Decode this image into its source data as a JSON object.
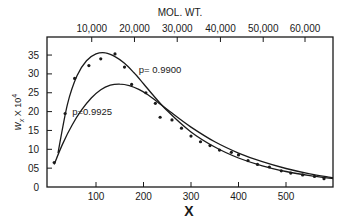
{
  "chart_data": {
    "type": "line",
    "title": "",
    "xlabel": "X",
    "ylabel": "w_x × 10^4",
    "top_xlabel": "MOL. WT.",
    "xlim": [
      0,
      600
    ],
    "ylim": [
      0,
      38
    ],
    "grid": false,
    "x_ticks": [
      100,
      200,
      300,
      400,
      500
    ],
    "x_tick_labels": [
      "100",
      "200",
      "300",
      "400",
      "500"
    ],
    "y_ticks": [
      0,
      5,
      10,
      15,
      20,
      25,
      30,
      35
    ],
    "y_tick_labels": [
      "0",
      "05",
      "10",
      "15",
      "20",
      "25",
      "30",
      "35"
    ],
    "top_x_ticks": [
      10000,
      20000,
      30000,
      40000,
      50000,
      60000
    ],
    "top_x_tick_labels": [
      "10,000",
      "20,000",
      "30,000",
      "40,000",
      "50,000",
      "60,000"
    ],
    "top_x_tick_positions_X": [
      91,
      181,
      271,
      362,
      452,
      540
    ],
    "series": [
      {
        "name": "p=0.9900",
        "kind": "curve",
        "label": "p= 0.9900",
        "x": [
          20,
          40,
          60,
          80,
          100,
          120,
          140,
          160,
          180,
          200,
          220,
          250,
          300,
          350,
          400,
          450,
          500,
          550,
          600
        ],
        "y": [
          9.0,
          22.0,
          29.5,
          33.5,
          35.3,
          35.6,
          34.6,
          32.8,
          30.3,
          27.4,
          24.4,
          20.2,
          14.6,
          10.6,
          7.7,
          5.6,
          4.1,
          3.0,
          2.2
        ]
      },
      {
        "name": "p=0.9925",
        "kind": "curve",
        "label": "p=0.9925",
        "x": [
          12,
          30,
          50,
          70,
          90,
          110,
          130,
          150,
          170,
          190,
          210,
          230,
          260,
          300,
          350,
          400,
          450,
          500,
          550,
          600
        ],
        "y": [
          6.0,
          11.5,
          16.5,
          20.5,
          23.6,
          25.8,
          27.0,
          27.3,
          26.9,
          25.9,
          24.4,
          22.5,
          19.6,
          15.9,
          12.0,
          9.0,
          6.7,
          4.9,
          3.5,
          2.5
        ]
      },
      {
        "name": "experimental",
        "kind": "points",
        "x": [
          12,
          35,
          55,
          85,
          110,
          140,
          160,
          175,
          205,
          225,
          235,
          260,
          280,
          300,
          320,
          340,
          360,
          385,
          400,
          420,
          440,
          465,
          490,
          510,
          535,
          560,
          580
        ],
        "y": [
          6.5,
          19.5,
          28.8,
          32.2,
          34.0,
          35.3,
          31.8,
          27.2,
          25.0,
          22.2,
          18.5,
          17.8,
          15.6,
          13.5,
          12.0,
          11.0,
          9.8,
          9.2,
          8.5,
          7.0,
          6.0,
          5.3,
          4.3,
          3.7,
          3.2,
          2.8,
          2.2
        ]
      }
    ],
    "annotations": [
      {
        "text": "p= 0.9900",
        "x": 190,
        "y": 31
      },
      {
        "text": "p=0.9925",
        "x": 50,
        "y": 20
      }
    ]
  }
}
